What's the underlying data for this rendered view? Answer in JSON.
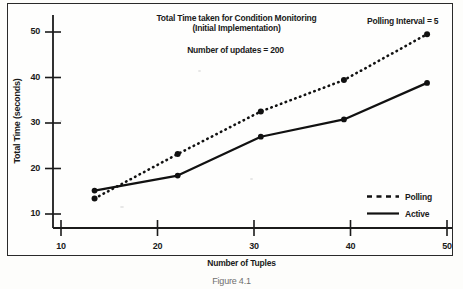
{
  "figure": {
    "caption": "Figure 4.1",
    "frame_color": "#2a2a2a"
  },
  "chart_data": {
    "type": "line",
    "title": "Total Time taken for Condition Monitoring",
    "subtitle_line2": "(Initial Implementation)",
    "subtitle": "Number of updates = 200",
    "annotation": "Polling Interval = 5",
    "xlabel": "Number of  Tuples",
    "ylabel": "Total  Time  (seconds)",
    "x": [
      10,
      20,
      30,
      40,
      50
    ],
    "xticks": [
      "10",
      "20",
      "30",
      "40",
      "50"
    ],
    "yticks": [
      "10",
      "20",
      "30",
      "40",
      "50"
    ],
    "xlim": [
      5,
      53
    ],
    "ylim": [
      7.5,
      53
    ],
    "grid": false,
    "legend_position": "right-inner",
    "series": [
      {
        "name": "Polling",
        "style": "dotted",
        "color": "#111111",
        "values": [
          13.8,
          23.3,
          32.4,
          39.1,
          48.9
        ]
      },
      {
        "name": "Active",
        "style": "solid",
        "color": "#111111",
        "values": [
          15.5,
          18.7,
          27.0,
          30.7,
          38.5
        ]
      }
    ]
  },
  "legend": {
    "items": [
      {
        "label": "Polling",
        "style": "dotted"
      },
      {
        "label": "Active",
        "style": "solid"
      }
    ]
  }
}
